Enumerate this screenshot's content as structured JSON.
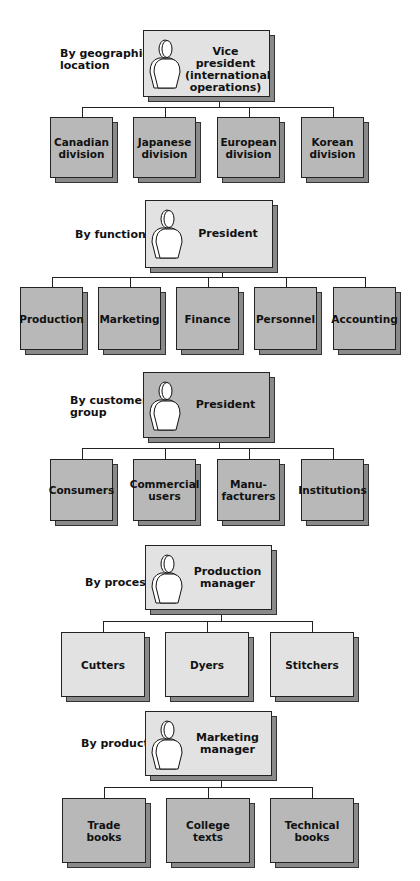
{
  "cut_top_text": "",
  "sections": [
    {
      "label": "By geographic location",
      "label_lines": [
        "By geographic",
        "location"
      ],
      "head": {
        "title_lines": [
          "Vice president",
          "(international",
          "operations)"
        ],
        "shade": "light"
      },
      "children": [
        {
          "lines": [
            "Canadian",
            "division"
          ]
        },
        {
          "lines": [
            "Japanese",
            "division"
          ]
        },
        {
          "lines": [
            "European",
            "division"
          ]
        },
        {
          "lines": [
            "Korean",
            "division"
          ]
        }
      ],
      "child_shade": "dark"
    },
    {
      "label": "By function",
      "label_lines": [
        "By function"
      ],
      "head": {
        "title_lines": [
          "President"
        ],
        "shade": "light"
      },
      "children": [
        {
          "lines": [
            "Production"
          ]
        },
        {
          "lines": [
            "Marketing"
          ]
        },
        {
          "lines": [
            "Finance"
          ]
        },
        {
          "lines": [
            "Personnel"
          ]
        },
        {
          "lines": [
            "Accounting"
          ]
        }
      ],
      "child_shade": "dark"
    },
    {
      "label": "By customer group",
      "label_lines": [
        "By customer",
        "group"
      ],
      "head": {
        "title_lines": [
          "President"
        ],
        "shade": "dark"
      },
      "children": [
        {
          "lines": [
            "Consumers"
          ]
        },
        {
          "lines": [
            "Commercial",
            "users"
          ]
        },
        {
          "lines": [
            "Manu-",
            "facturers"
          ]
        },
        {
          "lines": [
            "Institutions"
          ]
        }
      ],
      "child_shade": "dark"
    },
    {
      "label": "By process",
      "label_lines": [
        "By process"
      ],
      "head": {
        "title_lines": [
          "Production",
          "manager"
        ],
        "shade": "light"
      },
      "children": [
        {
          "lines": [
            "Cutters"
          ]
        },
        {
          "lines": [
            "Dyers"
          ]
        },
        {
          "lines": [
            "Stitchers"
          ]
        }
      ],
      "child_shade": "light"
    },
    {
      "label": "By product",
      "label_lines": [
        "By product"
      ],
      "head": {
        "title_lines": [
          "Marketing",
          "manager"
        ],
        "shade": "light"
      },
      "children": [
        {
          "lines": [
            "Trade",
            "books"
          ]
        },
        {
          "lines": [
            "College",
            "texts"
          ]
        },
        {
          "lines": [
            "Technical",
            "books"
          ]
        }
      ],
      "child_shade": "dark"
    }
  ],
  "icons": {
    "head_icon": "person-silhouette-icon"
  },
  "colors": {
    "dark_box": "#b8b8b8",
    "light_box": "#e2e2e2",
    "depth": "#8a8a8a",
    "line": "#222222"
  }
}
